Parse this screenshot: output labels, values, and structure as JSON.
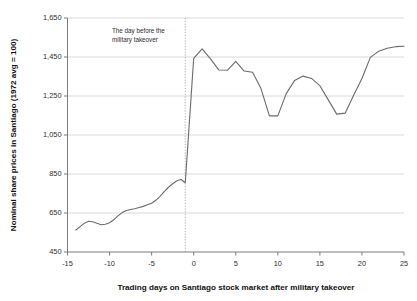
{
  "chart_data": {
    "type": "line",
    "title": "",
    "xlabel": "Trading days on Santiago stock market after military takeover",
    "ylabel": "Nominal share prices in Santiago (1972 avg = 100)",
    "xlim": [
      -15,
      25
    ],
    "ylim": [
      450,
      1650
    ],
    "xticks": [
      "-15",
      "-10",
      "-5",
      "0",
      "5",
      "10",
      "15",
      "20",
      "25"
    ],
    "xtick_values": [
      -15,
      -10,
      -5,
      0,
      5,
      10,
      15,
      20,
      25
    ],
    "yticks": [
      "450",
      "650",
      "850",
      "1,050",
      "1,250",
      "1,450",
      "1,650"
    ],
    "ytick_values": [
      450,
      650,
      850,
      1050,
      1250,
      1450,
      1650
    ],
    "grid": "horizontal",
    "legend": "none",
    "line_color": "#6b6b6b",
    "grid_color": "#c9c9c9",
    "axis_color": "#6e6e6e",
    "annotations": [
      {
        "name": "takeover-annotation",
        "text_line_1": "The day before the",
        "text_line_2": "military takeover",
        "marker_x": -1,
        "marker_type": "vertical-dotted-line"
      }
    ],
    "series": [
      {
        "name": "Nominal share prices in Santiago",
        "x": [
          -14,
          -13.5,
          -13,
          -12.5,
          -12,
          -11.5,
          -11,
          -10.5,
          -10,
          -9.5,
          -9,
          -8.5,
          -8,
          -7.5,
          -7,
          -6.5,
          -6,
          -5.5,
          -5,
          -4.5,
          -4,
          -3.5,
          -3,
          -2.5,
          -2,
          -1.5,
          -1,
          0,
          1,
          2,
          3,
          4,
          5,
          6,
          7,
          8,
          9,
          10,
          11,
          12,
          13,
          14,
          15,
          16,
          17,
          18,
          19,
          20,
          21,
          22,
          23,
          24,
          25
        ],
        "values": [
          563,
          580,
          598,
          608,
          605,
          597,
          590,
          592,
          600,
          615,
          635,
          652,
          663,
          668,
          672,
          678,
          684,
          692,
          700,
          715,
          735,
          760,
          782,
          800,
          815,
          822,
          805,
          1443,
          1492,
          1440,
          1383,
          1382,
          1428,
          1378,
          1372,
          1288,
          1148,
          1148,
          1262,
          1330,
          1352,
          1340,
          1303,
          1230,
          1157,
          1162,
          1252,
          1340,
          1448,
          1480,
          1495,
          1503,
          1505
        ]
      }
    ]
  }
}
